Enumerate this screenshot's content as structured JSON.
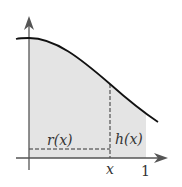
{
  "diagram": {
    "colors": {
      "shade": "#e4e4e4",
      "curve": "#111111",
      "axis": "#555555",
      "dashed": "#333333"
    },
    "labels": {
      "radius": "r(x)",
      "height": "h(x)",
      "x_tick": "x",
      "one_tick": "1"
    }
  }
}
